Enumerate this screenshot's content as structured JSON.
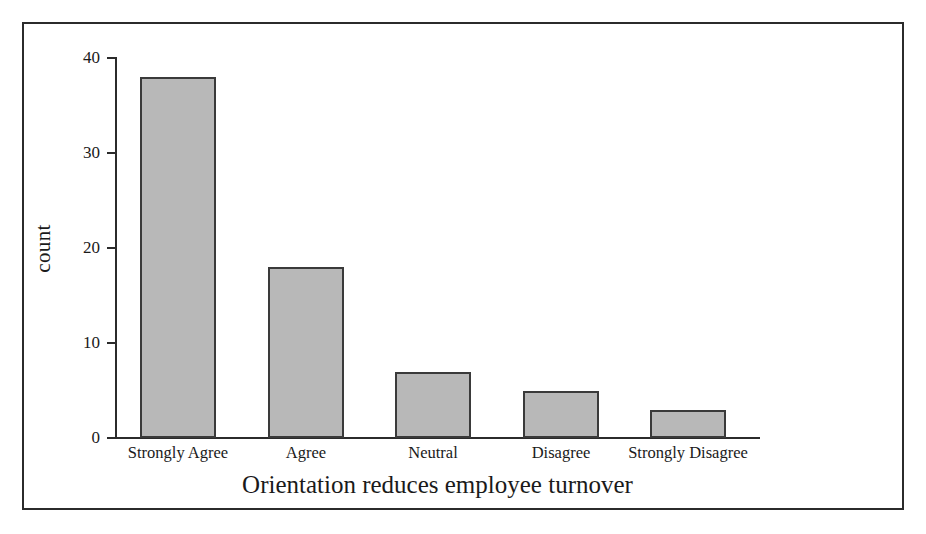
{
  "chart_data": {
    "type": "bar",
    "title": "",
    "xlabel": "Orientation reduces employee turnover",
    "ylabel": "count",
    "categories": [
      "Strongly Agree",
      "Agree",
      "Neutral",
      "Disagree",
      "Strongly Disagree"
    ],
    "values": [
      38,
      18,
      7,
      5,
      3
    ],
    "ylim": [
      0,
      40
    ],
    "yticks": [
      0,
      10,
      20,
      30,
      40
    ],
    "ytick_labels": [
      "0",
      "10",
      "20",
      "30",
      "40"
    ],
    "grid": false,
    "legend": null,
    "bar_fill_color": "#b8b8b8",
    "bar_edge_color": "#3a3a3a",
    "axis_color": "#2b2b2b",
    "frame_color": "#2b2b2b",
    "background_color": "#ffffff"
  },
  "axis": {
    "y_ticks": [
      {
        "label": "40",
        "value": 40
      },
      {
        "label": "30",
        "value": 30
      },
      {
        "label": "20",
        "value": 20
      },
      {
        "label": "10",
        "value": 10
      },
      {
        "label": "0",
        "value": 0
      }
    ],
    "y_title": "count",
    "x_title": "Orientation reduces employee turnover"
  },
  "bars": [
    {
      "label": "Strongly Agree",
      "value": 38
    },
    {
      "label": "Agree",
      "value": 18
    },
    {
      "label": "Neutral",
      "value": 7
    },
    {
      "label": "Disagree",
      "value": 5
    },
    {
      "label": "Strongly Disagree",
      "value": 3
    }
  ]
}
